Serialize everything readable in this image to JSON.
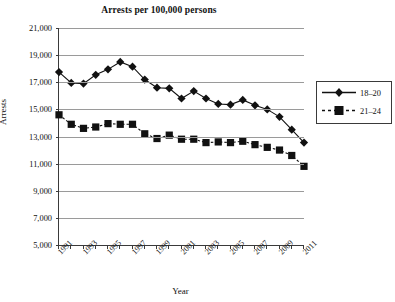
{
  "chart_data": {
    "type": "line",
    "title": "Arrests per 100,000 persons",
    "xlabel": "Year",
    "ylabel": "Arrests",
    "ylim": [
      5000,
      21000
    ],
    "ytick_step": 2000,
    "ytick_labels": [
      "21,000",
      "19,000",
      "17,000",
      "15,000",
      "13,000",
      "11,000",
      "9,000",
      "7,000",
      "5,000"
    ],
    "ytick_values": [
      21000,
      19000,
      17000,
      15000,
      13000,
      11000,
      9000,
      7000,
      5000
    ],
    "grid": true,
    "legend_position": "right",
    "x": [
      1991,
      1992,
      1993,
      1994,
      1995,
      1996,
      1997,
      1998,
      1999,
      2000,
      2001,
      2002,
      2003,
      2004,
      2005,
      2006,
      2007,
      2008,
      2009,
      2010,
      2011
    ],
    "xtick_labels": [
      "1991",
      "1993",
      "1995",
      "1997",
      "1999",
      "2001",
      "2003",
      "2005",
      "2007",
      "2009",
      "2011"
    ],
    "xtick_label_values": [
      1991,
      1993,
      1995,
      1997,
      1999,
      2001,
      2003,
      2005,
      2007,
      2009,
      2011
    ],
    "series": [
      {
        "name": "18–20",
        "marker": "diamond",
        "line_style": "solid",
        "color": "#111111",
        "values": [
          17750,
          16950,
          16900,
          17550,
          17950,
          18500,
          18150,
          17200,
          16600,
          16550,
          15800,
          16350,
          15800,
          15400,
          15350,
          15700,
          15300,
          15000,
          14450,
          13500,
          12550
        ]
      },
      {
        "name": "21–24",
        "marker": "square",
        "line_style": "dashed",
        "color": "#111111",
        "values": [
          14600,
          13900,
          13600,
          13700,
          13950,
          13900,
          13900,
          13200,
          12850,
          13100,
          12800,
          12800,
          12550,
          12600,
          12550,
          12650,
          12400,
          12200,
          12000,
          11600,
          10800
        ]
      }
    ]
  },
  "legend": {
    "items": [
      {
        "label": "18–20"
      },
      {
        "label": "21–24"
      }
    ]
  }
}
